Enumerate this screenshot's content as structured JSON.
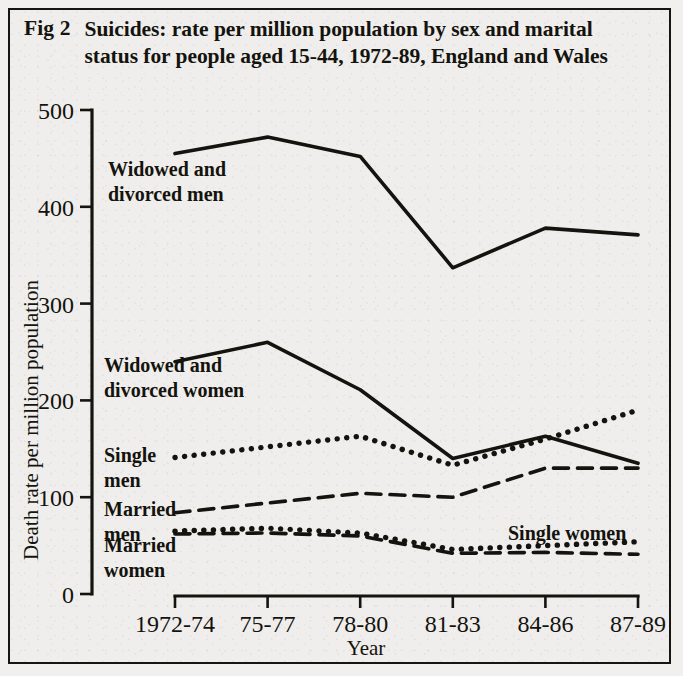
{
  "figure": {
    "number_label": "Fig 2",
    "caption": "Suicides: rate per million population by sex and marital status for people aged 15-44, 1972-89, England and Wales"
  },
  "chart_data": {
    "type": "line",
    "title": "Suicides: rate per million population by sex and marital status for people aged 15-44, 1972-89, England and Wales",
    "xlabel": "Year",
    "ylabel": "Death rate per million population",
    "categories": [
      "1972-74",
      "75-77",
      "78-80",
      "81-83",
      "84-86",
      "87-89"
    ],
    "xtick_labels": [
      "1972-74",
      "75-77",
      "78-80",
      "81-83",
      "84-86",
      "87-89"
    ],
    "ytick_labels": [
      "0",
      "100",
      "200",
      "300",
      "400",
      "500"
    ],
    "yticks": [
      0,
      100,
      200,
      300,
      400,
      500
    ],
    "ylim": [
      0,
      500
    ],
    "grid": false,
    "legend": "inline-labels",
    "series": [
      {
        "name": "Widowed and divorced men",
        "label": "Widowed and\ndivorced men",
        "style": "solid",
        "values": [
          455,
          472,
          452,
          337,
          378,
          371
        ]
      },
      {
        "name": "Widowed and divorced women",
        "label": "Widowed and\ndivorced women",
        "style": "solid",
        "values": [
          240,
          260,
          211,
          140,
          163,
          135
        ]
      },
      {
        "name": "Single men",
        "label": "Single\nmen",
        "style": "dotted",
        "values": [
          141,
          152,
          163,
          133,
          160,
          190
        ]
      },
      {
        "name": "Married men",
        "label": "Married\nmen",
        "style": "dashed",
        "values": [
          84,
          94,
          104,
          100,
          130,
          130
        ]
      },
      {
        "name": "Single women",
        "label": "Single women",
        "style": "dotted",
        "values": [
          65,
          68,
          63,
          46,
          50,
          54
        ]
      },
      {
        "name": "Married women",
        "label": "Married\nwomen",
        "style": "dashed",
        "values": [
          62,
          63,
          60,
          42,
          43,
          41
        ]
      }
    ],
    "annotations": [
      {
        "name": "widowed-divorced-men-label",
        "lines": [
          "Widowed and",
          "divorced men"
        ],
        "x": 108,
        "y": 176
      },
      {
        "name": "widowed-divorced-women-label",
        "lines": [
          "Widowed and",
          "divorced women"
        ],
        "x": 104,
        "y": 372
      },
      {
        "name": "single-men-label",
        "lines": [
          "Single",
          "men"
        ],
        "x": 104,
        "y": 462
      },
      {
        "name": "married-men-label",
        "lines": [
          "Married",
          "men"
        ],
        "x": 104,
        "y": 516
      },
      {
        "name": "married-women-label",
        "lines": [
          "Married",
          "women"
        ],
        "x": 104,
        "y": 552
      },
      {
        "name": "single-women-label",
        "lines": [
          "Single women"
        ],
        "x": 508,
        "y": 540
      }
    ],
    "colors": {
      "ink": "#14130e",
      "paper": "#efeeec"
    }
  }
}
